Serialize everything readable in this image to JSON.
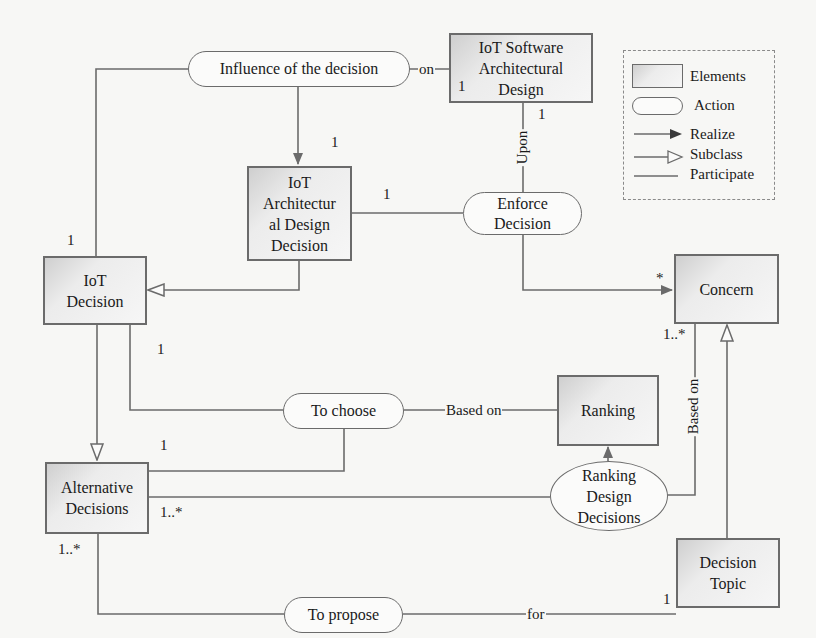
{
  "diagram": {
    "type": "conceptual-model",
    "elements": {
      "iot_software_arch_design": "IoT Software Architectural Design",
      "iot_arch_design_decision": "IoT Architectural Design Decision",
      "iot_decision": "IoT Decision",
      "concern": "Concern",
      "ranking": "Ranking",
      "alternative_decisions": "Alternative Decisions",
      "decision_topic": "Decision Topic"
    },
    "element_lines": {
      "iot_software_arch_design": [
        "IoT Software",
        "Architectural",
        "Design"
      ],
      "iot_arch_design_decision": [
        "IoT",
        "Architectur",
        "al Design",
        "Decision"
      ],
      "iot_decision": [
        "IoT",
        "Decision"
      ],
      "concern": [
        "Concern"
      ],
      "ranking": [
        "Ranking"
      ],
      "alternative_decisions": [
        "Alternative",
        "Decisions"
      ],
      "decision_topic": [
        "Decision",
        "Topic"
      ]
    },
    "actions": {
      "influence": "Influence of the decision",
      "enforce": [
        "Enforce",
        "Decision"
      ],
      "to_choose": "To choose",
      "ranking_design": [
        "Ranking",
        "Design",
        "Decisions"
      ],
      "to_propose": "To propose"
    },
    "edge_labels": {
      "on": "on",
      "upon": "Upon",
      "based_on_ranking": "Based on",
      "based_on_concern": "Based on",
      "for": "for"
    },
    "multiplicities": {
      "sw_design_left": "1",
      "sw_design_bottom": "1",
      "arch_decision_top": "1",
      "arch_decision_right": "1",
      "iot_decision_top": "1",
      "iot_decision_bottom": "1",
      "concern_left": "*",
      "concern_bottom": "1..*",
      "alt_to_choose": "1",
      "alt_right": "1..*",
      "alt_bottom": "1..*",
      "topic_left": "1"
    },
    "relations": [
      {
        "from": "Influence of the decision",
        "to": "IoT Architectural Design Decision",
        "type": "Realize"
      },
      {
        "from": "Influence of the decision",
        "to": "IoT Software Architectural Design",
        "type": "Participate",
        "label": "on"
      },
      {
        "from": "Influence of the decision",
        "to": "IoT Decision",
        "type": "Participate"
      },
      {
        "from": "IoT Architectural Design Decision",
        "to": "Enforce Decision",
        "type": "Participate"
      },
      {
        "from": "Enforce Decision",
        "to": "IoT Software Architectural Design",
        "type": "Participate",
        "label": "Upon"
      },
      {
        "from": "Enforce Decision",
        "to": "Concern",
        "type": "Realize"
      },
      {
        "from": "IoT Architectural Design Decision",
        "to": "IoT Decision",
        "type": "Subclass"
      },
      {
        "from": "IoT Decision",
        "to": "Alternative Decisions",
        "type": "Subclass"
      },
      {
        "from": "IoT Decision",
        "to": "To choose",
        "type": "Participate"
      },
      {
        "from": "To choose",
        "to": "Ranking",
        "type": "Participate",
        "label": "Based on"
      },
      {
        "from": "To choose",
        "to": "Alternative Decisions",
        "type": "Participate"
      },
      {
        "from": "Ranking Design Decisions",
        "to": "Ranking",
        "type": "Realize"
      },
      {
        "from": "Alternative Decisions",
        "to": "Ranking Design Decisions",
        "type": "Participate"
      },
      {
        "from": "Ranking Design Decisions",
        "to": "Concern",
        "type": "Participate",
        "label": "Based on"
      },
      {
        "from": "Decision Topic",
        "to": "Concern",
        "type": "Subclass"
      },
      {
        "from": "Alternative Decisions",
        "to": "To propose",
        "type": "Participate"
      },
      {
        "from": "To propose",
        "to": "Decision Topic",
        "type": "Participate",
        "label": "for"
      }
    ]
  },
  "legend": {
    "items": [
      {
        "symbol": "box",
        "label": "Elements"
      },
      {
        "symbol": "pill",
        "label": "Action"
      },
      {
        "symbol": "filled-arrow",
        "label": "Realize"
      },
      {
        "symbol": "hollow-arrow",
        "label": "Subclass"
      },
      {
        "symbol": "line",
        "label": "Participate"
      }
    ]
  },
  "colors": {
    "line": "#6b6b6b",
    "box_fill_dark": "#cfcfcf",
    "box_fill_light": "#f6f6f6",
    "background": "#f7f7f5"
  }
}
